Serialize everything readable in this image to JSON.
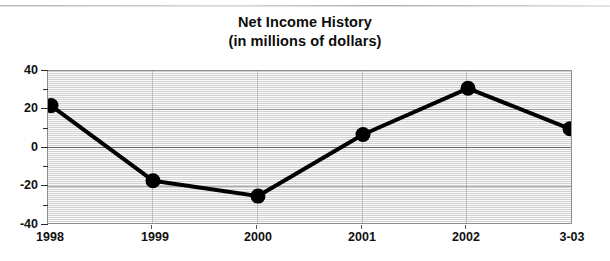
{
  "chart_data": {
    "type": "line",
    "title": "Net Income History",
    "subtitle": "(in millions of dollars)",
    "xlabel": "",
    "ylabel": "",
    "categories": [
      "1998",
      "1999",
      "2000",
      "2001",
      "2002",
      "3-03"
    ],
    "values": [
      22,
      -17,
      -25,
      7,
      31,
      10
    ],
    "series": [
      {
        "name": "Net Income",
        "values": [
          22,
          -17,
          -25,
          7,
          31,
          10
        ]
      }
    ],
    "ylim": [
      -40,
      40
    ],
    "ytick_labels": [
      "40",
      "20",
      "0",
      "-20",
      "-40"
    ],
    "ytick_values": [
      40,
      20,
      0,
      -20,
      -40
    ],
    "yminor_tick_values": [
      30,
      10,
      -10,
      -30
    ],
    "grid": true,
    "legend": "none",
    "marker": "filled-circle",
    "line_color": "#000000",
    "marker_color": "#000000",
    "plot_background": "#eeeeee",
    "gridline_color": "#737373",
    "axis_color": "#8e8e8e"
  }
}
